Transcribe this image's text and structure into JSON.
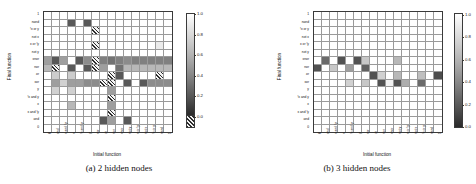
{
  "figure": {
    "axis_titles": {
      "x": "Initial function",
      "y": "Final function"
    },
    "colorbar": {
      "ticks": [
        "1.0",
        "0.8",
        "0.6",
        "0.4",
        "0.2",
        "0.0"
      ],
      "min": 0.0,
      "max": 1.0,
      "zero_swatch_label": "0.0",
      "colormap": "grayscale-0-black-to-1-white"
    },
    "function_labels_y": [
      "1",
      "nand",
      "!x or y",
      "not x",
      "x or !y",
      "not y",
      "xnor",
      "nor",
      "or",
      "xor",
      "y",
      "!x and y",
      "x",
      "x and !y",
      "and",
      "0"
    ],
    "function_labels_x": [
      "0",
      "and",
      "x and !y",
      "x",
      "!x and y",
      "y",
      "xor",
      "or",
      "nor",
      "xnor",
      "not y",
      "x or !y",
      "not x",
      "!x or y",
      "nand",
      "1"
    ]
  },
  "panels": [
    {
      "id": "panel-a",
      "caption": "(a) 2 hidden nodes",
      "chart_data": {
        "type": "heatmap",
        "title": "(a) 2 hidden nodes",
        "xlabel": "Initial function",
        "ylabel": "Final function",
        "xticklabels": [
          "0",
          "and",
          "x and !y",
          "x",
          "!x and y",
          "y",
          "xor",
          "or",
          "nor",
          "xnor",
          "not y",
          "x or !y",
          "not x",
          "!x or y",
          "nand",
          "1"
        ],
        "yticklabels": [
          "1",
          "nand",
          "!x or y",
          "not x",
          "x or !y",
          "not y",
          "xnor",
          "nor",
          "or",
          "xor",
          "y",
          "!x and y",
          "x",
          "x and !y",
          "and",
          "0"
        ],
        "zlim": [
          0.0,
          1.0
        ],
        "grid": true,
        "legend": "colorbar-right",
        "null_marker": "hatched",
        "values": [
          [
            1,
            1,
            1,
            1,
            1,
            1,
            1,
            1,
            1,
            1,
            1,
            1,
            1,
            1,
            1,
            1
          ],
          [
            1,
            1,
            1,
            0.35,
            1,
            0.35,
            1,
            1,
            1,
            1,
            1,
            1,
            1,
            1,
            1,
            1
          ],
          [
            1,
            1,
            1,
            1,
            1,
            1,
            "H",
            1,
            1,
            1,
            1,
            1,
            1,
            1,
            1,
            1
          ],
          [
            1,
            1,
            1,
            1,
            1,
            1,
            1,
            1,
            1,
            1,
            1,
            1,
            1,
            1,
            1,
            1
          ],
          [
            1,
            1,
            1,
            1,
            1,
            1,
            "H",
            1,
            1,
            1,
            1,
            1,
            1,
            1,
            0.92,
            1
          ],
          [
            1,
            1,
            1,
            1,
            1,
            1,
            1,
            1,
            1,
            1,
            1,
            1,
            1,
            1,
            1,
            1
          ],
          [
            0.62,
            0.35,
            0.62,
            1,
            0.35,
            0.55,
            "H",
            0.5,
            0.45,
            0.5,
            0.55,
            0.5,
            0.5,
            0.5,
            0.5,
            0.5
          ],
          [
            0.72,
            "H",
            1,
            0.35,
            1,
            0.35,
            "H",
            0.62,
            1,
            0.45,
            0.72,
            0.72,
            0.72,
            0.72,
            0.72,
            0.72
          ],
          [
            1,
            0.8,
            1,
            0.8,
            1,
            1,
            1,
            1,
            "H",
            0.35,
            1,
            1,
            1,
            1,
            "H",
            1
          ],
          [
            1,
            0.62,
            0.82,
            0.62,
            0.62,
            0.55,
            0.55,
            "H",
            "H",
            1,
            0.35,
            1,
            0.35,
            0.55,
            0.55,
            0.55
          ],
          [
            1,
            0.82,
            1,
            0.82,
            1,
            1,
            1,
            1,
            0.62,
            1,
            1,
            1,
            1,
            1,
            1,
            1
          ],
          [
            1,
            1,
            1,
            1,
            1,
            1,
            1,
            1,
            "H",
            1,
            1,
            1,
            1,
            1,
            1,
            1
          ],
          [
            1,
            1,
            1,
            0.72,
            1,
            1,
            1,
            1,
            0.62,
            1,
            1,
            1,
            1,
            1,
            1,
            1
          ],
          [
            1,
            1,
            1,
            1,
            1,
            1,
            1,
            1,
            "H",
            1,
            1,
            1,
            1,
            1,
            1,
            1
          ],
          [
            1,
            1,
            1,
            1,
            1,
            1,
            1,
            0.35,
            0.62,
            1,
            0.35,
            1,
            1,
            1,
            1,
            1
          ],
          [
            1,
            1,
            1,
            1,
            1,
            1,
            1,
            1,
            1,
            1,
            1,
            1,
            1,
            1,
            1,
            1
          ]
        ]
      }
    },
    {
      "id": "panel-b",
      "caption": "(b) 3 hidden nodes",
      "chart_data": {
        "type": "heatmap",
        "title": "(b) 3 hidden nodes",
        "xlabel": "Initial function",
        "ylabel": "Final function",
        "xticklabels": [
          "0",
          "and",
          "x and !y",
          "x",
          "!x and y",
          "y",
          "xor",
          "or",
          "nor",
          "xnor",
          "not y",
          "x or !y",
          "not x",
          "!x or y",
          "nand",
          "1"
        ],
        "yticklabels": [
          "1",
          "nand",
          "!x or y",
          "not x",
          "x or !y",
          "not y",
          "xnor",
          "nor",
          "or",
          "xor",
          "y",
          "!x and y",
          "x",
          "x and !y",
          "and",
          "0"
        ],
        "zlim": [
          0.0,
          1.0
        ],
        "grid": true,
        "legend": "colorbar-right",
        "values": [
          [
            1,
            1,
            1,
            1,
            1,
            1,
            1,
            1,
            1,
            1,
            1,
            1,
            1,
            1,
            1,
            1
          ],
          [
            1,
            1,
            1,
            1,
            1,
            1,
            1,
            1,
            1,
            1,
            1,
            1,
            1,
            1,
            1,
            1
          ],
          [
            1,
            1,
            1,
            1,
            1,
            1,
            1,
            1,
            1,
            1,
            1,
            1,
            1,
            1,
            1,
            1
          ],
          [
            1,
            1,
            1,
            1,
            1,
            1,
            1,
            1,
            1,
            1,
            1,
            1,
            1,
            1,
            1,
            1
          ],
          [
            1,
            1,
            1,
            1,
            1,
            1,
            1,
            1,
            1,
            1,
            1,
            1,
            1,
            1,
            1,
            1
          ],
          [
            1,
            1,
            1,
            1,
            1,
            1,
            1,
            1,
            1,
            1,
            1,
            1,
            1,
            1,
            1,
            1
          ],
          [
            1,
            0.42,
            1,
            0.32,
            1,
            0.32,
            0.78,
            1,
            1,
            1,
            0.72,
            1,
            1,
            1,
            1,
            1
          ],
          [
            0.32,
            1,
            0.78,
            1,
            0.62,
            1,
            0.38,
            1,
            1,
            1,
            1,
            1,
            1,
            1,
            1,
            1
          ],
          [
            1,
            1,
            1,
            1,
            1,
            1,
            1,
            0.32,
            0.82,
            1,
            0.72,
            1,
            1,
            0.75,
            1,
            0.3
          ],
          [
            1,
            1,
            1,
            1,
            0.82,
            1,
            0.78,
            1,
            0.32,
            0.95,
            0.32,
            0.68,
            1,
            0.42,
            1,
            1
          ],
          [
            1,
            1,
            1,
            1,
            1,
            1,
            1,
            1,
            1,
            1,
            1,
            1,
            1,
            1,
            1,
            1
          ],
          [
            1,
            1,
            1,
            1,
            1,
            1,
            1,
            1,
            1,
            1,
            1,
            1,
            1,
            1,
            1,
            1
          ],
          [
            1,
            1,
            1,
            1,
            1,
            1,
            1,
            1,
            1,
            1,
            1,
            1,
            1,
            1,
            1,
            1
          ],
          [
            1,
            1,
            1,
            1,
            1,
            1,
            1,
            1,
            1,
            1,
            1,
            1,
            1,
            1,
            1,
            1
          ],
          [
            1,
            1,
            1,
            1,
            1,
            1,
            1,
            1,
            1,
            1,
            1,
            1,
            1,
            1,
            1,
            1
          ],
          [
            1,
            1,
            1,
            1,
            1,
            1,
            1,
            1,
            1,
            1,
            1,
            1,
            1,
            1,
            1,
            1
          ]
        ]
      }
    }
  ]
}
